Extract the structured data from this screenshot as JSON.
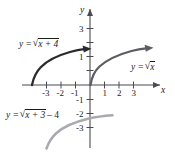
{
  "figure": {
    "type": "graph",
    "background_color": "#ffffff",
    "axes": {
      "x_axis_name": "x",
      "y_axis_name": "y",
      "x_ticks": [
        "-3",
        "-2",
        "-1",
        "1",
        "2",
        "3"
      ],
      "y_ticks": [
        "3",
        "1",
        "-1",
        "-2",
        "-3"
      ],
      "x_range": [
        -4.6,
        4.9
      ],
      "y_range": [
        -4.6,
        3.9
      ],
      "grid": false
    },
    "curves": [
      {
        "id": "curve-shift-left-4",
        "label_parts": {
          "lhs": "y =",
          "radicand": "x + 4",
          "tail": ""
        },
        "label_plain": "y = sqrt(x + 4)",
        "color": "#2b2b2e",
        "formula": "sqrt(x+4)",
        "domain_start": -4,
        "domain_end": 0,
        "arrow": true
      },
      {
        "id": "curve-base",
        "label_parts": {
          "lhs": "y =",
          "radicand": "x",
          "tail": ""
        },
        "label_plain": "y = sqrt(x)",
        "color": "#5c5c62",
        "formula": "sqrt(x)",
        "domain_start": 0,
        "domain_end": 4.5,
        "arrow": true
      },
      {
        "id": "curve-shift-left-3-down-4",
        "label_parts": {
          "lhs": "y =",
          "radicand": "x + 3",
          "tail": "– 4"
        },
        "label_plain": "y = sqrt(x + 3) - 4",
        "color": "#a9a9ae",
        "formula": "sqrt(x+3)-4",
        "domain_start": -3,
        "domain_end": 1.6,
        "arrow": false
      }
    ],
    "symbols": {
      "radical_sign": "√",
      "minus_sign": "–"
    }
  }
}
